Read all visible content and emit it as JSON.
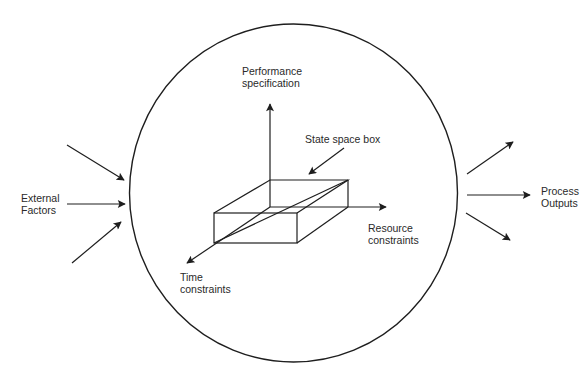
{
  "diagram": {
    "type": "process-system-diagram",
    "boundary": "circle",
    "colors": {
      "stroke": "#1e1e1e",
      "text": "#2a2a2a",
      "background": "#ffffff"
    },
    "labels": {
      "performance": {
        "line1": "Performance",
        "line2": "specification"
      },
      "state_space_box": {
        "line1": "State space box"
      },
      "resource": {
        "line1": "Resource",
        "line2": "constraints"
      },
      "time": {
        "line1": "Time",
        "line2": "constraints"
      },
      "external": {
        "line1": "External",
        "line2": "Factors"
      },
      "outputs": {
        "line1": "Process",
        "line2": "Outputs"
      }
    },
    "axes": [
      {
        "name": "Performance specification",
        "direction": "up"
      },
      {
        "name": "Resource constraints",
        "direction": "right"
      },
      {
        "name": "Time constraints",
        "direction": "diagonal-down-left"
      }
    ],
    "inputs": {
      "label": "External Factors",
      "arrow_count": 3
    },
    "outputs": {
      "label": "Process Outputs",
      "arrow_count": 3
    }
  }
}
